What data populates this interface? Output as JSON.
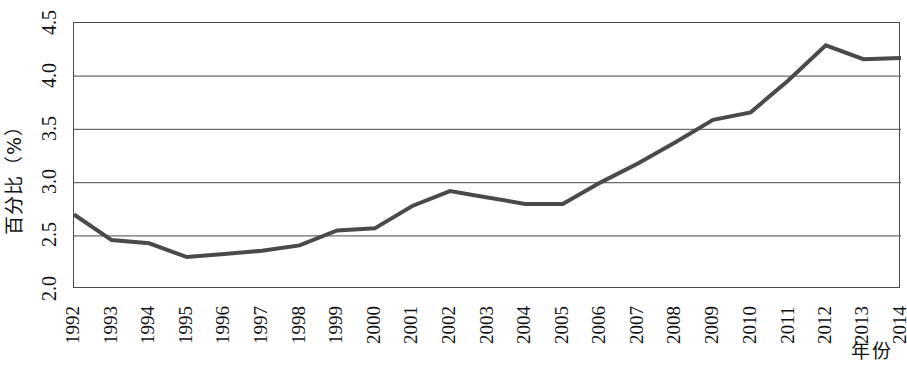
{
  "chart_data": {
    "type": "line",
    "title": "",
    "xlabel": "年份",
    "ylabel": "百分比（%）",
    "x": [
      1992,
      1993,
      1994,
      1995,
      1996,
      1997,
      1998,
      1999,
      2000,
      2001,
      2002,
      2003,
      2004,
      2005,
      2006,
      2007,
      2008,
      2009,
      2010,
      2011,
      2012,
      2013,
      2014
    ],
    "xtick_labels": [
      "1992",
      "1993",
      "1994",
      "1995",
      "1996",
      "1997",
      "1998",
      "1999",
      "2000",
      "2001",
      "2002",
      "2003",
      "2004",
      "2005",
      "2006",
      "2007",
      "2008",
      "2009",
      "2010",
      "2011",
      "2012",
      "2013",
      "2014"
    ],
    "values": [
      2.7,
      2.46,
      2.43,
      2.3,
      2.33,
      2.36,
      2.41,
      2.55,
      2.57,
      2.78,
      2.92,
      2.86,
      2.8,
      2.8,
      3.0,
      3.18,
      3.38,
      3.59,
      3.66,
      3.96,
      4.29,
      4.16,
      4.17
    ],
    "ylim": [
      2.0,
      4.5
    ],
    "xlim": [
      1992,
      2014
    ],
    "ytick_values": [
      2.0,
      2.5,
      3.0,
      3.5,
      4.0,
      4.5
    ],
    "ytick_labels": [
      "2.0",
      "2.5",
      "3.0",
      "3.5",
      "4.0",
      "4.5"
    ],
    "grid": "horizontal",
    "legend": "none",
    "series_color": "#4a4a4a",
    "line_width": 4,
    "grid_color": "#6b6b6b",
    "frame_color": "#4a4a4a",
    "background": "#ffffff"
  }
}
